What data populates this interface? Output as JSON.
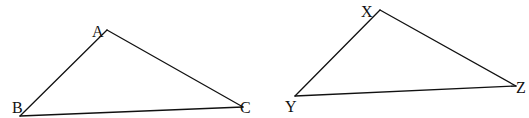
{
  "diagram": {
    "type": "geometry-triangles",
    "background": "#ffffff",
    "stroke_color": "#111111",
    "triangles": [
      {
        "name": "ABC",
        "vertices": {
          "A": {
            "label": "A",
            "x": 107,
            "y": 30,
            "label_x": 92,
            "label_y": 37
          },
          "B": {
            "label": "B",
            "x": 20,
            "y": 116,
            "label_x": 12,
            "label_y": 113
          },
          "C": {
            "label": "C",
            "x": 243,
            "y": 107,
            "label_x": 240,
            "label_y": 113
          }
        }
      },
      {
        "name": "XYZ",
        "vertices": {
          "X": {
            "label": "X",
            "x": 380,
            "y": 10,
            "label_x": 361,
            "label_y": 17
          },
          "Y": {
            "label": "Y",
            "x": 295,
            "y": 96,
            "label_x": 285,
            "label_y": 112
          },
          "Z": {
            "label": "Z",
            "x": 516,
            "y": 86,
            "label_x": 516,
            "label_y": 93
          }
        }
      }
    ]
  }
}
